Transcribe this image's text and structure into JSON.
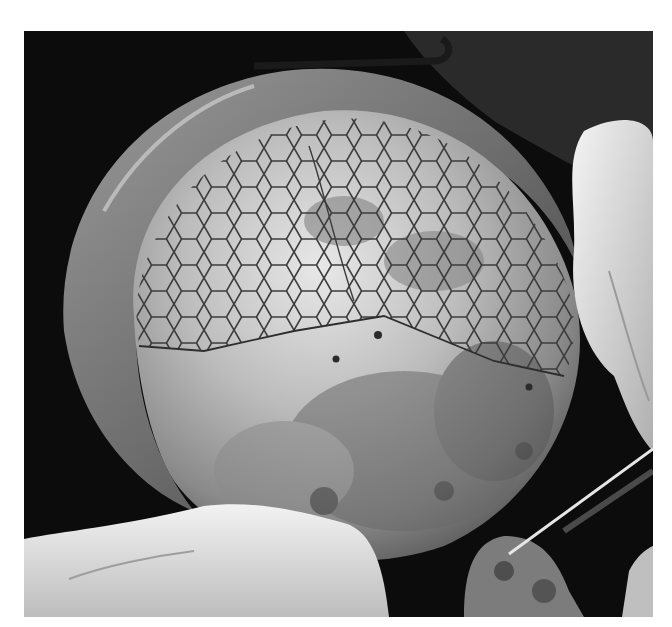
{
  "image": {
    "kind": "photograph",
    "color_mode": "grayscale",
    "alt": "Grayscale intraoperative photograph of a large rounded organ surface partially covered by a hexagonal mesh, held by gloved hands, with a surgical instrument at lower right",
    "colors": {
      "background_margin": "#ffffff",
      "dark_field": "#0c0c0c",
      "organ_light": "#d9d9d9",
      "organ_mid": "#8e8e8e",
      "mesh_line": "#3a3a3a",
      "glove": "#e6e6e6",
      "tissue_rim": "#6a6a6a"
    }
  }
}
